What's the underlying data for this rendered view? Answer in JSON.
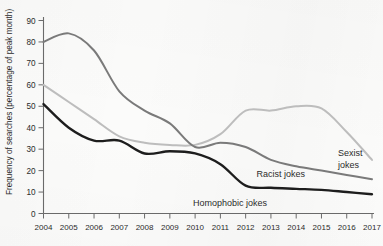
{
  "chart_data": {
    "type": "line",
    "title": "",
    "xlabel": "",
    "ylabel": "Frequency of searches (percentage of peak month)",
    "xlim": [
      2004,
      2017
    ],
    "ylim": [
      0,
      90
    ],
    "grid": false,
    "legend_position": "inline-right-of-series",
    "categories": [
      2004,
      2005,
      2006,
      2007,
      2008,
      2009,
      2010,
      2011,
      2012,
      2013,
      2014,
      2015,
      2016,
      2017
    ],
    "xtick_labels": [
      "2004",
      "2005",
      "2006",
      "2007",
      "2008",
      "2009",
      "2010",
      "2011",
      "2012",
      "2013",
      "2014",
      "2015",
      "2016",
      "2017"
    ],
    "ytick_labels": [
      "0",
      "10",
      "20",
      "30",
      "40",
      "50",
      "60",
      "70",
      "80",
      "90"
    ],
    "ytick_values": [
      0,
      10,
      20,
      30,
      40,
      50,
      60,
      70,
      80,
      90
    ],
    "series": [
      {
        "name": "Sexist jokes",
        "color": "#bdbdbd",
        "values": [
          60,
          52,
          44,
          36,
          33,
          32,
          32,
          37,
          48,
          48,
          50,
          49,
          38,
          25
        ]
      },
      {
        "name": "Racist jokes",
        "color": "#7a7a7a",
        "values": [
          80,
          84,
          76,
          57,
          48,
          42,
          31,
          33,
          31,
          25,
          22,
          20,
          18,
          16
        ]
      },
      {
        "name": "Homophobic jokes",
        "color": "#1d1d1d",
        "values": [
          51,
          40,
          34,
          34,
          28,
          29,
          28,
          23,
          13,
          12,
          11.5,
          11,
          10,
          9
        ]
      }
    ]
  },
  "axis": {
    "y_title": "Frequency of searches (percentage of peak month)"
  },
  "labels": {
    "sexist": "Sexist\njokes",
    "sexist_line1": "Sexist",
    "sexist_line2": "jokes",
    "racist": "Racist jokes",
    "homophobic": "Homophobic jokes"
  }
}
